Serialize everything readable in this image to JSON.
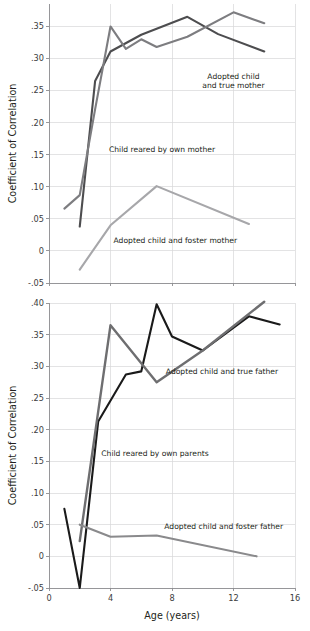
{
  "figure": {
    "background": "#ffffff",
    "axis_color": "#8d8d90",
    "grid_color": "#d7d7d9"
  },
  "chart_data": [
    {
      "id": "mothers",
      "type": "line",
      "title": "",
      "xlabel": "",
      "ylabel": "Coefficient of Correlation",
      "xlim": [
        0,
        16
      ],
      "ylim": [
        -0.05,
        0.385
      ],
      "xticks": [
        0,
        4,
        8,
        12,
        16
      ],
      "xticklabels": [
        "0",
        "4",
        "8",
        "12",
        "16"
      ],
      "xticklabels_visible": false,
      "yticks": [
        -0.05,
        0,
        0.05,
        0.1,
        0.15,
        0.2,
        0.25,
        0.3,
        0.35
      ],
      "yticklabels": [
        "-.05",
        "0",
        ".05",
        ".10",
        ".15",
        ".20",
        ".25",
        ".30",
        ".35"
      ],
      "grid": true,
      "legend_position": "inline-annotations",
      "series": [
        {
          "name": "Child reared by own mother",
          "color": "#4d4d4f",
          "width": 2.1,
          "x": [
            2,
            3,
            4,
            6,
            9,
            11,
            14
          ],
          "y": [
            0.038,
            0.265,
            0.311,
            0.337,
            0.365,
            0.338,
            0.311
          ],
          "label": {
            "text": "Child reared by own mother",
            "x": 3.9,
            "y": 0.155,
            "anchor": "start"
          }
        },
        {
          "name": "Adopted child and true mother",
          "color": "#7d7d80",
          "width": 2.1,
          "x": [
            1,
            2,
            3,
            4,
            5,
            6,
            7,
            9,
            12,
            14
          ],
          "y": [
            0.066,
            0.087,
            0.221,
            0.35,
            0.315,
            0.33,
            0.318,
            0.334,
            0.372,
            0.355
          ],
          "label": {
            "text": "Adopted child\nand true mother",
            "x": 12.0,
            "y": 0.268,
            "anchor": "middle"
          }
        },
        {
          "name": "Adopted child and foster mother",
          "color": "#a7a7aa",
          "width": 2.1,
          "x": [
            2,
            4,
            7,
            13
          ],
          "y": [
            -0.029,
            0.04,
            0.101,
            0.042
          ],
          "label": {
            "text": "Adopted child and foster mother",
            "x": 4.2,
            "y": 0.012,
            "anchor": "start"
          }
        }
      ]
    },
    {
      "id": "fathers",
      "type": "line",
      "title": "",
      "xlabel": "Age (years)",
      "ylabel": "Coefficient of Correlation",
      "xlim": [
        0,
        16
      ],
      "ylim": [
        -0.05,
        0.4
      ],
      "xticks": [
        0,
        4,
        8,
        12,
        16
      ],
      "xticklabels": [
        "0",
        "4",
        "8",
        "12",
        "16"
      ],
      "xticklabels_visible": true,
      "yticks": [
        -0.05,
        0,
        0.05,
        0.1,
        0.15,
        0.2,
        0.25,
        0.3,
        0.35,
        0.4
      ],
      "yticklabels": [
        "-.05",
        "0",
        ".05",
        ".10",
        ".15",
        ".20",
        ".25",
        ".30",
        ".35",
        ".40"
      ],
      "grid": true,
      "legend_position": "inline-annotations",
      "series": [
        {
          "name": "Child reared by own parents",
          "color": "#1a1a1a",
          "width": 2.1,
          "x": [
            1,
            2,
            3.2,
            5,
            6,
            7,
            8,
            10,
            13,
            15
          ],
          "y": [
            0.075,
            -0.05,
            0.213,
            0.287,
            0.292,
            0.398,
            0.347,
            0.325,
            0.379,
            0.366
          ],
          "label": {
            "text": "Child reared by own parents",
            "x": 3.4,
            "y": 0.158,
            "anchor": "start"
          }
        },
        {
          "name": "Adopted child and true father",
          "color": "#6e6e70",
          "width": 2.4,
          "x": [
            2,
            4,
            7,
            10,
            14
          ],
          "y": [
            0.024,
            0.365,
            0.275,
            0.325,
            0.402
          ],
          "label": {
            "text": "Adopted child and true father",
            "x": 7.6,
            "y": 0.288,
            "anchor": "start"
          }
        },
        {
          "name": "Adopted child and foster father",
          "color": "#8a8a8c",
          "width": 2.1,
          "x": [
            2,
            4,
            7,
            13.5
          ],
          "y": [
            0.05,
            0.031,
            0.033,
            0.0
          ],
          "label": {
            "text": "Adopted child and foster father",
            "x": 7.5,
            "y": 0.043,
            "anchor": "start"
          }
        }
      ]
    }
  ]
}
